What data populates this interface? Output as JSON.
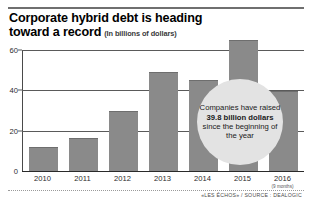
{
  "title": {
    "line1": "Corporate hybrid debt is heading",
    "line2": "toward a record",
    "subtitle": "(In billions of dollars)"
  },
  "source": "«LES ÉCHOS» / SOURCE : DEALOGIC",
  "callout": {
    "text_before": "Companies have raised ",
    "highlight": "39.8 billion dollars",
    "text_after": " since the beginning of the year",
    "full_text": "Companies have raised 39.8 billion dollars since the beginning of the year"
  },
  "axis": {
    "y_ticks": [
      "0",
      "20",
      "40",
      "60"
    ],
    "x_note_2016": "(9 months)"
  },
  "colors": {
    "bar": "#8a8a8a",
    "callout_bg": "#e3e3e3",
    "axis": "#4a4a4a",
    "text": "#1a1a1a"
  },
  "chart_data": {
    "type": "bar",
    "title": "Corporate hybrid debt is heading toward a record",
    "subtitle": "(In billions of dollars)",
    "categories": [
      "2010",
      "2011",
      "2012",
      "2013",
      "2014",
      "2015",
      "2016"
    ],
    "values": [
      12,
      16.5,
      30,
      49,
      45,
      65,
      39.8
    ],
    "xlabel": "",
    "ylabel": "In billions of dollars",
    "ylim": [
      0,
      66
    ],
    "yticks": [
      0,
      20,
      40,
      60
    ],
    "grid": true,
    "legend": "none",
    "annotations": [
      {
        "text": "Companies have raised 39.8 billion dollars since the beginning of the year",
        "near_category": "2015"
      },
      {
        "text": "(9 months)",
        "near_category": "2016"
      }
    ],
    "source": "«LES ÉCHOS» / SOURCE : DEALOGIC"
  }
}
